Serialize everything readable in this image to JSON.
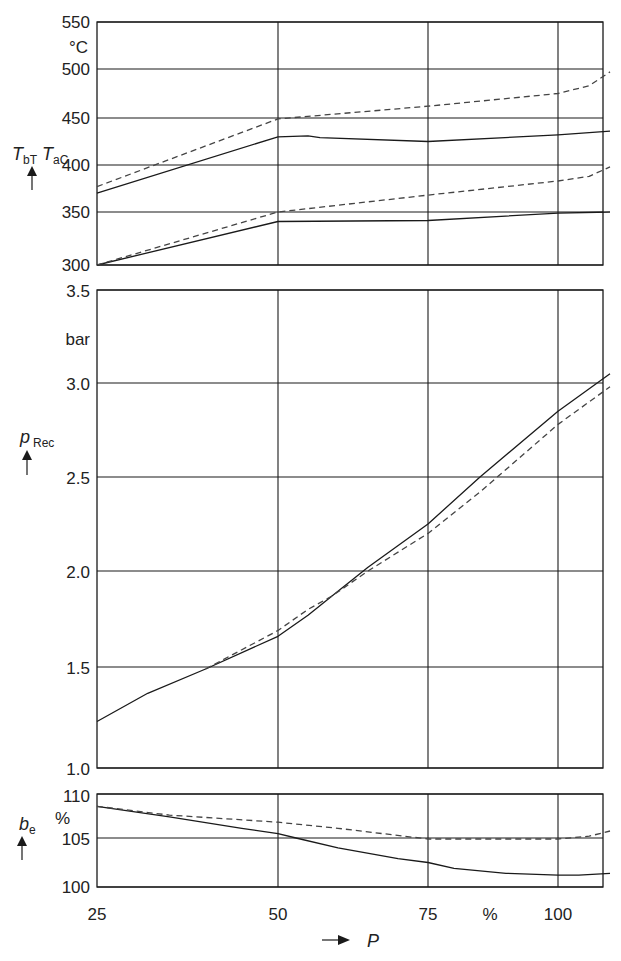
{
  "chart_data": [
    {
      "type": "line",
      "panel": "temperature",
      "title": "",
      "ylabel": "T_bT T_aC",
      "ylabel_main": "T",
      "ylabel_sub1": "bT",
      "ylabel_sub2": "aC",
      "yunit": "°C",
      "ylim": [
        300,
        550
      ],
      "yticks": [
        300,
        350,
        400,
        450,
        500,
        550
      ],
      "xlim": [
        25,
        110
      ],
      "xgrid": [
        50,
        75,
        100
      ],
      "grid": true,
      "series": [
        {
          "name": "upper solid",
          "style": "solid",
          "x": [
            25,
            50,
            55,
            57,
            75,
            100,
            110
          ],
          "y": [
            370,
            430,
            431,
            429,
            425,
            432,
            436
          ]
        },
        {
          "name": "upper dashed",
          "style": "dashed",
          "x": [
            25,
            50,
            75,
            100,
            106,
            110
          ],
          "y": [
            377,
            449,
            462,
            475,
            483,
            497
          ]
        },
        {
          "name": "lower solid",
          "style": "solid",
          "x": [
            25,
            50,
            75,
            100,
            110
          ],
          "y": [
            300,
            341,
            342,
            349,
            350
          ]
        },
        {
          "name": "lower dashed",
          "style": "dashed",
          "x": [
            25,
            50,
            75,
            100,
            106,
            110
          ],
          "y": [
            300,
            350,
            368,
            383,
            388,
            398
          ]
        }
      ]
    },
    {
      "type": "line",
      "panel": "pressure",
      "ylabel": "p_Rec",
      "ylabel_main": "p",
      "ylabel_sub": "Rec",
      "yunit": "bar",
      "ylim": [
        1.0,
        3.5
      ],
      "yticks": [
        "1.0",
        "1.5",
        "2.0",
        "2.5",
        "3.0",
        "3.5"
      ],
      "xlim": [
        25,
        110
      ],
      "xgrid": [
        50,
        75,
        100
      ],
      "grid": true,
      "series": [
        {
          "name": "solid",
          "style": "solid",
          "x": [
            25,
            32,
            40,
            50,
            55,
            59,
            65,
            75,
            85,
            100,
            110
          ],
          "y": [
            1.23,
            1.37,
            1.49,
            1.66,
            1.77,
            1.87,
            2.02,
            2.25,
            2.5,
            2.85,
            3.05
          ]
        },
        {
          "name": "dashed",
          "style": "dashed",
          "x": [
            40,
            50,
            55,
            59,
            65,
            75,
            85,
            100,
            110
          ],
          "y": [
            1.49,
            1.69,
            1.8,
            1.87,
            2.0,
            2.2,
            2.42,
            2.78,
            2.98
          ]
        }
      ]
    },
    {
      "type": "line",
      "panel": "specific-fuel-consumption",
      "ylabel": "b_e",
      "ylabel_main": "b",
      "ylabel_sub": "e",
      "yunit": "%",
      "ylim": [
        100,
        110
      ],
      "yticks": [
        100,
        105,
        110
      ],
      "xlim": [
        25,
        110
      ],
      "xticks": [
        25,
        50,
        75,
        100
      ],
      "xgrid": [
        50,
        75,
        100
      ],
      "xlabel": "P",
      "xunit": "%",
      "grid": true,
      "series": [
        {
          "name": "solid",
          "style": "solid",
          "x": [
            25,
            35,
            45,
            50,
            53,
            60,
            70,
            75,
            80,
            90,
            100,
            104,
            110
          ],
          "y": [
            108.6,
            107.4,
            106.1,
            105.5,
            105.0,
            104.0,
            102.9,
            102.5,
            101.9,
            101.4,
            101.2,
            101.2,
            101.4
          ]
        },
        {
          "name": "dashed",
          "style": "dashed",
          "x": [
            25,
            35,
            50,
            60,
            75,
            85,
            100,
            106,
            110
          ],
          "y": [
            108.6,
            107.6,
            106.8,
            106.1,
            104.9,
            104.9,
            104.9,
            105.2,
            105.8
          ]
        }
      ]
    }
  ],
  "labels": {
    "temp_unit": "°C",
    "pressure_unit": "bar",
    "be_unit": "%",
    "x_unit": "%",
    "x_symbol": "P",
    "temp_ticks": [
      "550",
      "500",
      "450",
      "400",
      "350",
      "300"
    ],
    "pressure_ticks": [
      "3.5",
      "3.0",
      "2.5",
      "2.0",
      "1.5",
      "1.0"
    ],
    "be_ticks": [
      "110",
      "105",
      "100"
    ],
    "x_ticks": [
      "25",
      "50",
      "75",
      "100"
    ]
  },
  "colors": {
    "line": "#1a1a1a",
    "grid": "#1a1a1a",
    "dashed": "#444444"
  }
}
